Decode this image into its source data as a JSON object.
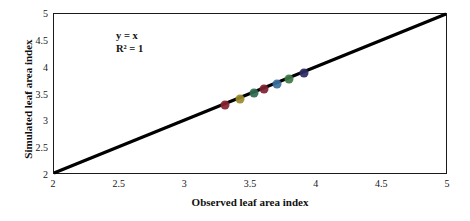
{
  "chart_data": {
    "type": "scatter",
    "title": "",
    "xlabel": "Observed leaf area index",
    "ylabel": "Simulated leaf area index",
    "xlim": [
      2,
      5
    ],
    "ylim": [
      2,
      5
    ],
    "xticks": [
      "2",
      "2.5",
      "3",
      "3.5",
      "4",
      "4.5",
      "5"
    ],
    "yticks": [
      "2",
      "2.5",
      "3",
      "3.5",
      "4",
      "4.5",
      "5"
    ],
    "xtick_values": [
      2,
      2.5,
      3,
      3.5,
      4,
      4.5,
      5
    ],
    "ytick_values": [
      2,
      2.5,
      3,
      3.5,
      4,
      4.5,
      5
    ],
    "grid": false,
    "legend": null,
    "annotations": [
      "y = x",
      "R² = 1"
    ],
    "reference_line": {
      "name": "one-to-one-line",
      "equation": "y = x",
      "from": [
        2,
        2
      ],
      "to": [
        5,
        5
      ],
      "color": "#000000"
    },
    "series": [
      {
        "name": "leaf-area-index-points",
        "points": [
          {
            "x": 3.3,
            "y": 3.3,
            "color": "#8a2230"
          },
          {
            "x": 3.42,
            "y": 3.42,
            "color": "#9a8b2a"
          },
          {
            "x": 3.52,
            "y": 3.52,
            "color": "#2e6b50"
          },
          {
            "x": 3.6,
            "y": 3.6,
            "color": "#7d2231"
          },
          {
            "x": 3.7,
            "y": 3.7,
            "color": "#3a6f9e"
          },
          {
            "x": 3.79,
            "y": 3.79,
            "color": "#3f7a46"
          },
          {
            "x": 3.9,
            "y": 3.9,
            "color": "#2d2a63"
          }
        ]
      }
    ]
  },
  "axes": {
    "x_title": "Observed leaf area index",
    "y_title": "Simulated leaf area index"
  },
  "annotation": {
    "line1": "y = x",
    "line2": "R² = 1"
  }
}
